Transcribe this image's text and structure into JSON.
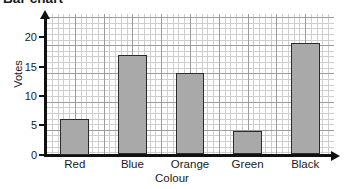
{
  "title": "Bar chart",
  "axis": {
    "y_title": "Votes",
    "x_title": "Colour",
    "y_ticks": [
      "0",
      "5",
      "10",
      "15",
      "20"
    ]
  },
  "chart_data": {
    "type": "bar",
    "title": "Bar chart",
    "xlabel": "Colour",
    "ylabel": "Votes",
    "categories": [
      "Red",
      "Blue",
      "Orange",
      "Green",
      "Black"
    ],
    "values": [
      6,
      17,
      14,
      4,
      19
    ],
    "ylim": [
      0,
      24
    ],
    "y_ticks": [
      0,
      5,
      10,
      15,
      20
    ],
    "grid": true,
    "grid_minor_step": 1,
    "grid_major_step": 5,
    "legend": null,
    "bar_fill_color": "#a9a9a9",
    "bar_border_color": "#2b2b2b",
    "grid_minor_color": "#cfcfcf",
    "grid_major_color": "#9c9c9c",
    "axis_color": "#111111"
  }
}
